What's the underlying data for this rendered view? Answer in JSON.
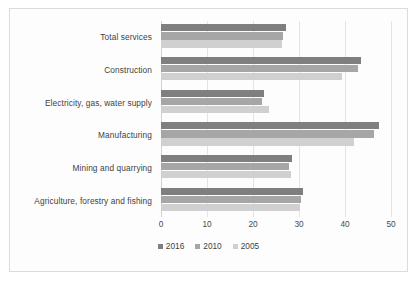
{
  "chart_data": {
    "type": "bar",
    "orientation": "horizontal",
    "title": "",
    "xlabel": "",
    "ylabel": "",
    "xlim": [
      0,
      50
    ],
    "xticks": [
      0,
      10,
      20,
      30,
      40,
      50
    ],
    "grid": true,
    "legend_position": "bottom",
    "categories": [
      "Total services",
      "Construction",
      "Electricity, gas, water supply",
      "Manufacturing",
      "Mining and quarrying",
      "Agriculture, forestry and fishing"
    ],
    "series": [
      {
        "name": "2016",
        "color": "#7f7f7f",
        "values": [
          27.2,
          43.5,
          22.4,
          47.4,
          28.5,
          30.9
        ]
      },
      {
        "name": "2010",
        "color": "#a6a6a6",
        "values": [
          26.5,
          42.8,
          22.0,
          46.3,
          27.8,
          30.4
        ]
      },
      {
        "name": "2005",
        "color": "#d0d0d0",
        "values": [
          26.3,
          39.3,
          23.5,
          41.9,
          28.3,
          30.2
        ]
      }
    ]
  },
  "style": {
    "frame_border": "#dcdcdc",
    "gridline": "#e4e4e4",
    "axis_line": "#d2d2d2",
    "background": "#fdfdfd",
    "text": "#3f3f3f"
  }
}
